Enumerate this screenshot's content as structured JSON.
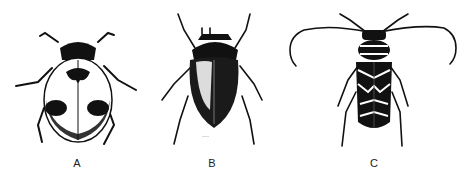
{
  "figure": {
    "panels": [
      {
        "label": "A",
        "subject": "ladybird beetle with spotted elytra"
      },
      {
        "label": "B",
        "subject": "dark glossy scarab beetle"
      },
      {
        "label": "C",
        "subject": "long-horned beetle with banded pattern"
      }
    ],
    "colors": {
      "ink": "#111111",
      "background": "#ffffff"
    }
  }
}
